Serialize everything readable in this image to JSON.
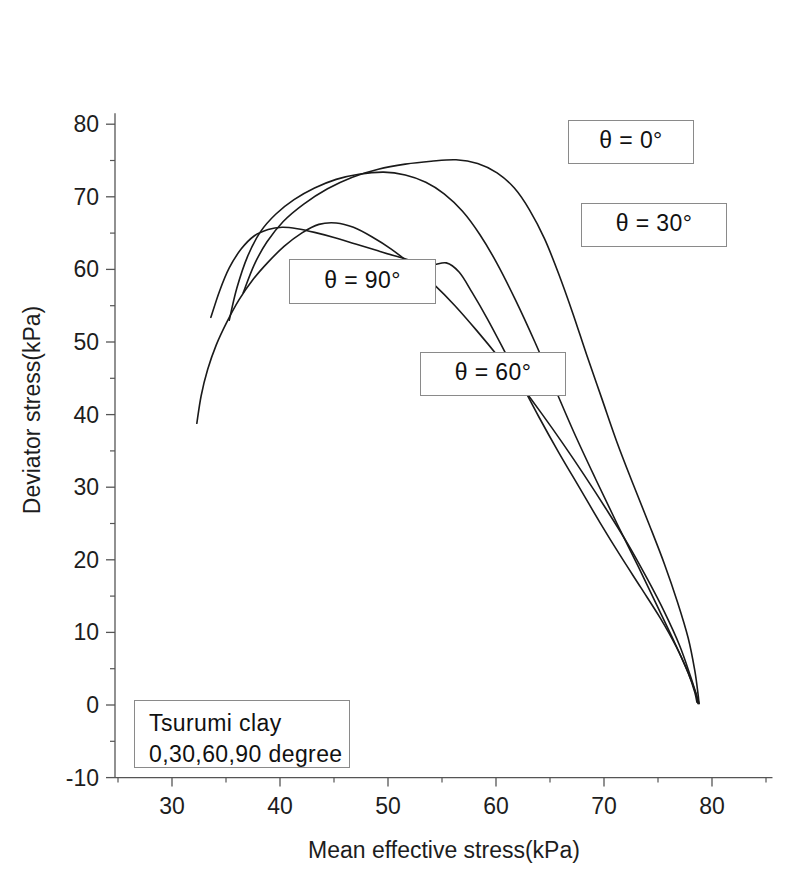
{
  "chart_data": {
    "type": "line",
    "title": "",
    "xlabel": "Mean effective stress(kPa)",
    "ylabel": "Deviator stress(kPa)",
    "xlim": [
      25.2,
      85.6
    ],
    "ylim": [
      -10,
      81.5
    ],
    "xticks": [
      30,
      40,
      50,
      60,
      70,
      80
    ],
    "xtick_labels": [
      "30",
      "40",
      "50",
      "60",
      "70",
      "80"
    ],
    "xminor_step": 5,
    "yticks": [
      -10,
      0,
      10,
      20,
      30,
      40,
      50,
      60,
      70,
      80
    ],
    "ytick_labels": [
      "-10",
      "0",
      "10",
      "20",
      "30",
      "40",
      "50",
      "60",
      "70",
      "80"
    ],
    "yminor_step": 5,
    "grid": false,
    "legend": "none",
    "line_color": "#1a1a1a",
    "line_width": 1.6,
    "series": [
      {
        "name": "theta = 0",
        "label": "θ = 0°",
        "points": [
          [
            35.3,
            53.0
          ],
          [
            36.0,
            57.4
          ],
          [
            37.0,
            61.8
          ],
          [
            38.2,
            65.2
          ],
          [
            39.6,
            67.6
          ],
          [
            41.3,
            69.6
          ],
          [
            43.2,
            71.2
          ],
          [
            45.2,
            72.4
          ],
          [
            47.3,
            73.1
          ],
          [
            49.6,
            73.4
          ],
          [
            51.6,
            73.0
          ],
          [
            53.5,
            72.0
          ],
          [
            55.2,
            70.4
          ],
          [
            56.9,
            68.0
          ],
          [
            58.5,
            64.8
          ],
          [
            60.1,
            60.8
          ],
          [
            61.8,
            55.8
          ],
          [
            63.6,
            50.0
          ],
          [
            65.4,
            43.8
          ],
          [
            67.2,
            37.6
          ],
          [
            69.2,
            31.2
          ],
          [
            71.2,
            25.0
          ],
          [
            73.2,
            19.0
          ],
          [
            75.0,
            13.4
          ],
          [
            76.6,
            8.4
          ],
          [
            77.8,
            4.4
          ],
          [
            78.4,
            1.8
          ],
          [
            78.6,
            0.4
          ]
        ]
      },
      {
        "name": "theta = 30",
        "label": "θ = 30°",
        "points": [
          [
            36.6,
            56.8
          ],
          [
            37.6,
            60.6
          ],
          [
            38.8,
            63.8
          ],
          [
            40.3,
            66.6
          ],
          [
            42.2,
            69.0
          ],
          [
            44.4,
            71.1
          ],
          [
            46.7,
            72.7
          ],
          [
            49.1,
            73.8
          ],
          [
            51.6,
            74.5
          ],
          [
            54.0,
            74.9
          ],
          [
            56.3,
            75.1
          ],
          [
            58.3,
            74.6
          ],
          [
            60.1,
            73.3
          ],
          [
            61.7,
            71.2
          ],
          [
            63.1,
            68.2
          ],
          [
            64.5,
            64.2
          ],
          [
            65.8,
            59.4
          ],
          [
            67.1,
            54.0
          ],
          [
            68.4,
            48.2
          ],
          [
            69.8,
            42.2
          ],
          [
            71.2,
            36.2
          ],
          [
            72.7,
            30.4
          ],
          [
            74.2,
            24.8
          ],
          [
            75.6,
            19.4
          ],
          [
            76.8,
            14.2
          ],
          [
            77.8,
            9.2
          ],
          [
            78.4,
            4.8
          ],
          [
            78.7,
            1.6
          ],
          [
            78.8,
            0.2
          ]
        ]
      },
      {
        "name": "theta = 60",
        "label": "θ = 60°",
        "points": [
          [
            33.6,
            53.4
          ],
          [
            34.4,
            57.0
          ],
          [
            35.3,
            60.2
          ],
          [
            36.4,
            62.8
          ],
          [
            37.6,
            64.6
          ],
          [
            38.9,
            65.5
          ],
          [
            40.2,
            65.8
          ],
          [
            41.6,
            65.6
          ],
          [
            43.2,
            65.1
          ],
          [
            45.0,
            64.4
          ],
          [
            47.0,
            63.5
          ],
          [
            49.2,
            62.5
          ],
          [
            51.5,
            61.5
          ],
          [
            53.8,
            60.6
          ],
          [
            55.4,
            60.9
          ],
          [
            56.6,
            59.6
          ],
          [
            57.8,
            56.8
          ],
          [
            59.2,
            53.2
          ],
          [
            60.7,
            49.0
          ],
          [
            62.3,
            44.4
          ],
          [
            64.0,
            39.6
          ],
          [
            65.8,
            34.8
          ],
          [
            67.7,
            30.0
          ],
          [
            69.6,
            25.2
          ],
          [
            71.5,
            20.6
          ],
          [
            73.4,
            16.2
          ],
          [
            75.2,
            12.0
          ],
          [
            76.7,
            8.0
          ],
          [
            77.8,
            4.4
          ],
          [
            78.5,
            1.6
          ],
          [
            78.7,
            0.2
          ]
        ]
      },
      {
        "name": "theta = 90",
        "label": "θ = 90°",
        "points": [
          [
            32.3,
            38.8
          ],
          [
            32.7,
            42.6
          ],
          [
            33.3,
            46.2
          ],
          [
            34.1,
            49.6
          ],
          [
            35.1,
            52.8
          ],
          [
            36.2,
            55.8
          ],
          [
            37.5,
            58.6
          ],
          [
            38.9,
            61.0
          ],
          [
            40.4,
            63.2
          ],
          [
            42.0,
            65.0
          ],
          [
            43.6,
            66.2
          ],
          [
            45.2,
            66.4
          ],
          [
            46.8,
            65.8
          ],
          [
            48.5,
            64.5
          ],
          [
            50.3,
            62.8
          ],
          [
            52.2,
            60.6
          ],
          [
            54.2,
            58.0
          ],
          [
            56.2,
            55.0
          ],
          [
            58.2,
            51.6
          ],
          [
            60.2,
            48.0
          ],
          [
            62.2,
            44.2
          ],
          [
            64.2,
            40.2
          ],
          [
            66.2,
            36.0
          ],
          [
            68.2,
            31.6
          ],
          [
            70.2,
            27.0
          ],
          [
            72.2,
            22.2
          ],
          [
            74.0,
            17.4
          ],
          [
            75.6,
            12.8
          ],
          [
            77.0,
            8.2
          ],
          [
            78.0,
            4.0
          ],
          [
            78.6,
            1.2
          ],
          [
            78.8,
            0.2
          ]
        ]
      }
    ],
    "annotations": [
      {
        "name": "theta-0",
        "text": "θ = 0°",
        "x": 568,
        "y": 120,
        "w": 126,
        "h": 44
      },
      {
        "name": "theta-30",
        "text": "θ = 30°",
        "x": 581,
        "y": 203,
        "w": 146,
        "h": 44
      },
      {
        "name": "theta-90",
        "text": "θ = 90°",
        "x": 289,
        "y": 259,
        "w": 147,
        "h": 45
      },
      {
        "name": "theta-60",
        "text": "θ = 60°",
        "x": 420,
        "y": 352,
        "w": 146,
        "h": 44
      }
    ],
    "caption_box": {
      "name": "sample-caption",
      "line1": "Tsurumi clay",
      "line2": "0,30,60,90 degree",
      "x": 134,
      "y": 700,
      "w": 216,
      "h": 68
    }
  }
}
